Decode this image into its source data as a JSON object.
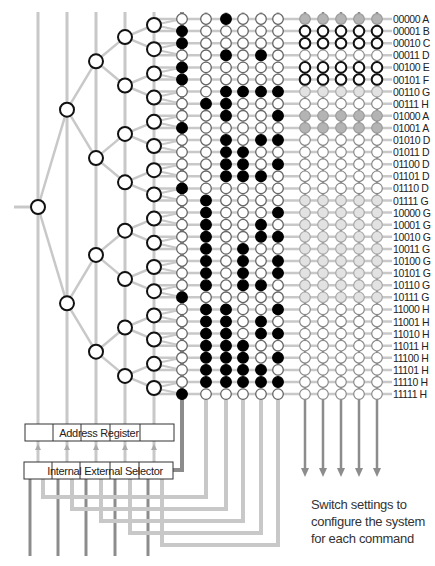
{
  "diagram": {
    "row_labels": [
      "00000 A",
      "00001 B",
      "00010 C",
      "00011 D",
      "00100 E",
      "00101 F",
      "00110 G",
      "00111 H",
      "01000 A",
      "01001 A",
      "01010 D",
      "01011 D",
      "01100 D",
      "01101 D",
      "01110 D",
      "01111 G",
      "10000 G",
      "10001 G",
      "10010 G",
      "10011 G",
      "10100 G",
      "10101 G",
      "10110 G",
      "10111 G",
      "11000 H",
      "11001 H",
      "11010 H",
      "11011 H",
      "11100 H",
      "11101 H",
      "11110 H",
      "11111 H"
    ],
    "switch_matrix": {
      "columns": 6,
      "filled_cells": [
        [
          2
        ],
        [
          0
        ],
        [
          0
        ],
        [
          2,
          4
        ],
        [
          0
        ],
        [
          0
        ],
        [
          2,
          3,
          4,
          5
        ],
        [
          1,
          2
        ],
        [
          2,
          5
        ],
        [
          0
        ],
        [
          2,
          4,
          5
        ],
        [
          2,
          3
        ],
        [
          2,
          3,
          5
        ],
        [
          2,
          3,
          4
        ],
        [
          0
        ],
        [
          1
        ],
        [
          1,
          5
        ],
        [
          1,
          4
        ],
        [
          1,
          4,
          5
        ],
        [
          1,
          3
        ],
        [
          1,
          3,
          5
        ],
        [
          1,
          3,
          5
        ],
        [
          1,
          3,
          4
        ],
        [
          0
        ],
        [
          1,
          2,
          5
        ],
        [
          1,
          2,
          4
        ],
        [
          1,
          2,
          4,
          5
        ],
        [
          1,
          2,
          3
        ],
        [
          1,
          2,
          3,
          5
        ],
        [
          1,
          2,
          3,
          4
        ],
        [
          1,
          2,
          3,
          4,
          5
        ],
        [
          0
        ]
      ]
    },
    "output_columns": {
      "count": 5,
      "row_styles": [
        "gray",
        "dark",
        "dark",
        "light",
        "dark",
        "dark",
        "pale",
        "light",
        "gray",
        "gray",
        "light",
        "light",
        "light",
        "light",
        "light",
        "pale",
        "pale",
        "pale",
        "pale",
        "pale",
        "pale",
        "pale",
        "pale",
        "pale",
        "light",
        "light",
        "light",
        "light",
        "light",
        "light",
        "light",
        "light"
      ]
    },
    "boxes": {
      "address_register": "Address Register",
      "internal_external_selector": "Internal External Selector"
    },
    "caption": [
      "Switch settings to",
      "configure the system",
      "for each command"
    ],
    "colors": {
      "line": "#c8c8c8",
      "dark_line": "#8c8c8c",
      "node_stroke": "#111111",
      "filled": "#000000",
      "gray_fill": "#b4b4b4",
      "pale_fill": "#e2e2e2",
      "light_stroke": "#8a8a8a"
    }
  }
}
